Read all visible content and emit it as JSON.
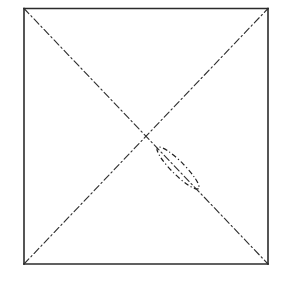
{
  "figure": {
    "background_color": "#ffffff",
    "ink_color": "#1a1a1a",
    "canvas": {
      "width": 281,
      "height": 283
    },
    "square": {
      "name": "outer-square",
      "left": 24,
      "top": 8.5,
      "right": 268,
      "bottom": 264,
      "stroke_color": "#2b2b2b",
      "stroke_width": 1.6,
      "line_style": "solid"
    },
    "diagonals": [
      {
        "name": "diagonal-tl-br",
        "from": {
          "x": 24,
          "y": 8.5
        },
        "to": {
          "x": 268,
          "y": 264
        },
        "stroke_color": "#2d2d2d",
        "stroke_width": 1.1,
        "line_style": "dash-dot",
        "dash_pattern": "7 3 1.5 3"
      },
      {
        "name": "diagonal-bl-tr",
        "from": {
          "x": 24,
          "y": 264
        },
        "to": {
          "x": 268,
          "y": 8.5
        },
        "stroke_color": "#2d2d2d",
        "stroke_width": 1.1,
        "line_style": "dash-dot",
        "dash_pattern": "7 3 1.5 3"
      }
    ],
    "intersection": {
      "name": "diagonal-intersection-point",
      "x": 146,
      "y": 136
    },
    "ellipse": {
      "name": "lens-ellipse",
      "center": {
        "x": 178,
        "y": 168
      },
      "semi_major": 29,
      "semi_minor": 6.5,
      "rotation_deg": 45,
      "stroke_color": "#202020",
      "stroke_width": 1.2,
      "line_style": "dash-dot",
      "dash_pattern": "5 2.5 1.2 2.5",
      "fill": "none"
    }
  },
  "labels": {
    "figure_caption": "",
    "annotations": []
  }
}
